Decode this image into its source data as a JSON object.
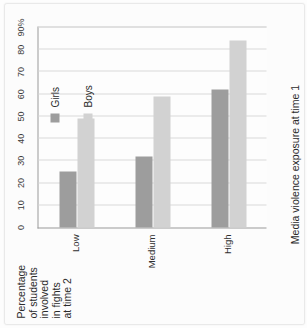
{
  "chart_data": {
    "type": "bar",
    "orientation": "horizontal",
    "title": "",
    "ylabel": "Percentage of students involved in fights at time 2",
    "xlabel": "Media violence exposure at time 1",
    "categories": [
      "Low",
      "Medium",
      "High"
    ],
    "series": [
      {
        "name": "Girls",
        "color": "#9d9d9d",
        "values": [
          25,
          32,
          62
        ]
      },
      {
        "name": "Boys",
        "color": "#d2d2d2",
        "values": [
          49,
          59,
          84
        ]
      }
    ],
    "value_axis": {
      "min": 0,
      "max": 90,
      "step": 10,
      "ticks": [
        "0",
        "10",
        "20",
        "30",
        "40",
        "50",
        "60",
        "70",
        "80",
        "90%"
      ]
    },
    "grid": true,
    "legend_position": "inside-right"
  },
  "axis_titles": {
    "value_axis_lines": [
      "Percentage",
      "of students",
      "involved",
      "in fights",
      "at time 2"
    ],
    "category_axis": "Media violence exposure at time 1"
  },
  "legend": {
    "items": [
      {
        "label": "Girls",
        "swatch": "girls-swatch-icon"
      },
      {
        "label": "Boys",
        "swatch": "boys-swatch-icon"
      }
    ]
  }
}
